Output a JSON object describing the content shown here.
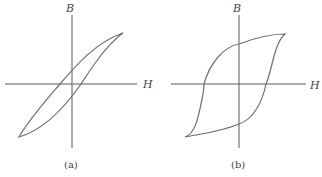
{
  "figures": [
    {
      "id": "a",
      "caption": "(a)",
      "x_axis_label": "H",
      "y_axis_label": "B",
      "description": "Narrow hysteresis loop (soft magnetic material)"
    },
    {
      "id": "b",
      "caption": "(b)",
      "x_axis_label": "H",
      "y_axis_label": "B",
      "description": "Wide hysteresis loop (hard magnetic material)"
    }
  ],
  "colors": {
    "axis": "#5a5a5a",
    "curve": "#6e6e6e",
    "background": "#ffffff"
  }
}
